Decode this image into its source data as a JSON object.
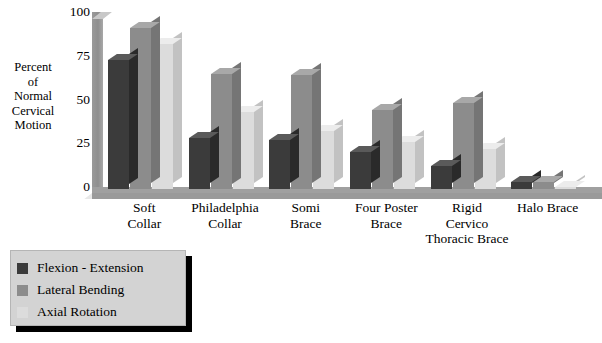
{
  "chart_data": {
    "type": "bar",
    "title": "",
    "subtitle": "",
    "xlabel": "",
    "ylabel": "Percent of Normal Cervical Motion",
    "ylabel_lines": [
      "Percent",
      "of",
      "Normal",
      "Cervical",
      "Motion"
    ],
    "ylim": [
      0,
      100
    ],
    "yticks": [
      0,
      25,
      50,
      75,
      100
    ],
    "ytick_labels": [
      "0",
      "25",
      "50",
      "75",
      "100"
    ],
    "grid": false,
    "legend_position": "below-left",
    "style": "3d-column",
    "categories": [
      "Soft Collar",
      "Philadelphia Collar",
      "Somi Brace",
      "Four Poster Brace",
      "Rigid Cervico Thoracic Brace",
      "Halo Brace"
    ],
    "category_lines": [
      [
        "Soft",
        "Collar"
      ],
      [
        "Philadelphia",
        "Collar"
      ],
      [
        "Somi",
        "Brace"
      ],
      [
        "Four Poster",
        "Brace"
      ],
      [
        "Rigid",
        "Cervico",
        "Thoracic Brace"
      ],
      [
        "Halo Brace"
      ]
    ],
    "series": [
      {
        "name": "Flexion - Extension",
        "color": "#3b3b3b",
        "values": [
          74,
          29,
          28,
          21,
          13,
          4
        ]
      },
      {
        "name": "Lateral Bending",
        "color": "#8c8c8c",
        "values": [
          92,
          66,
          65,
          45,
          49,
          4
        ]
      },
      {
        "name": "Axial Rotation",
        "color": "#dcdcdc",
        "values": [
          83,
          44,
          33,
          27,
          23,
          1
        ]
      }
    ]
  },
  "legend": {
    "items": [
      {
        "label": "Flexion - Extension",
        "color": "#3b3b3b"
      },
      {
        "label": "Lateral Bending",
        "color": "#8c8c8c"
      },
      {
        "label": "Axial Rotation",
        "color": "#dcdcdc"
      }
    ]
  }
}
